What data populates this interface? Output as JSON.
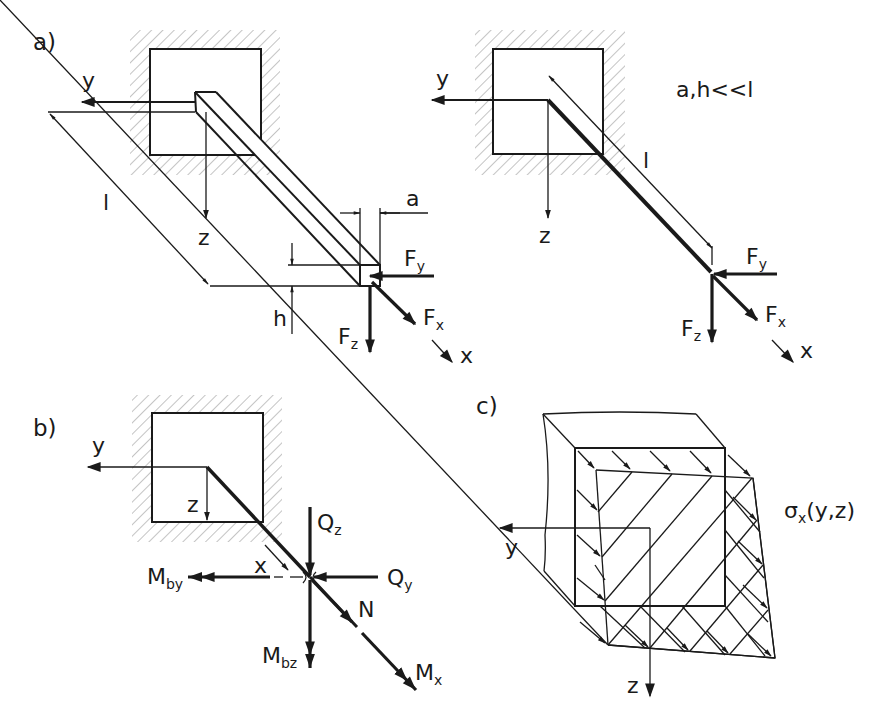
{
  "figure": {
    "panels": [
      {
        "id": "a-left",
        "label": "a)",
        "description": "Cantilever beam of rectangular cross-section a × h and length l, fixed in a wall, loaded at free end by forces Fx, Fy, Fz",
        "axes": {
          "y": "y",
          "z": "z",
          "x": "x"
        },
        "dimensions": {
          "length": "l",
          "width": "a",
          "height": "h"
        },
        "forces": {
          "fx": "F",
          "fx_sub": "x",
          "fy": "F",
          "fy_sub": "y",
          "fz": "F",
          "fz_sub": "z"
        }
      },
      {
        "id": "a-right",
        "label": "",
        "description": "Idealized beam (line model) with same loads",
        "condition": "a,h<<l",
        "axes": {
          "y": "y",
          "z": "z",
          "x": "x"
        },
        "dimensions": {
          "length": "l"
        },
        "forces": {
          "fx": "F",
          "fx_sub": "x",
          "fy": "F",
          "fy_sub": "y",
          "fz": "F",
          "fz_sub": "z"
        }
      },
      {
        "id": "b",
        "label": "b)",
        "description": "Internal forces and moments at section x",
        "axes": {
          "y": "y",
          "z": "z",
          "x": "x"
        },
        "internal": {
          "qz": "Q",
          "qz_sub": "z",
          "qy": "Q",
          "qy_sub": "y",
          "n": "N",
          "mby": "M",
          "mby_sub": "by",
          "mbz": "M",
          "mbz_sub": "bz",
          "mx": "M",
          "mx_sub": "x"
        }
      },
      {
        "id": "c",
        "label": "c)",
        "description": "Normal stress distribution over the cross-section",
        "axes": {
          "y": "y",
          "z": "z"
        },
        "stress": {
          "sigma": "σ",
          "sigma_sub": "x",
          "args": "(y,z)"
        }
      }
    ]
  }
}
